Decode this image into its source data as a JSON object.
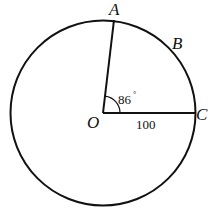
{
  "diagram": {
    "points": {
      "A": "A",
      "B": "B",
      "C": "C",
      "O": "O"
    },
    "angle_AOC": "86°",
    "angle_value": "86",
    "angle_degree_symbol": "°",
    "segment_OC_length": "100"
  }
}
